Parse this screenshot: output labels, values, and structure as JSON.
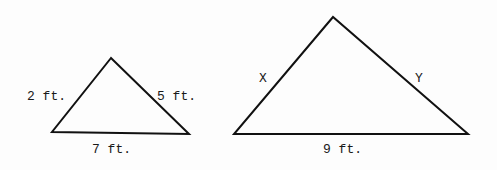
{
  "figure": {
    "line_color": "#111111",
    "background": "#fdfdfd",
    "triangles": [
      {
        "id": "small",
        "vertices": {
          "apex": [
            111,
            58
          ],
          "left": [
            52,
            132
          ],
          "right": [
            189,
            134
          ]
        },
        "labels": {
          "left_side": "2 ft.",
          "right_side": "5 ft.",
          "base": "7 ft."
        }
      },
      {
        "id": "large",
        "vertices": {
          "apex": [
            333,
            17
          ],
          "left": [
            234,
            134
          ],
          "right": [
            468,
            134
          ]
        },
        "labels": {
          "left_side": "X",
          "right_side": "Y",
          "base": "9 ft."
        }
      }
    ]
  }
}
